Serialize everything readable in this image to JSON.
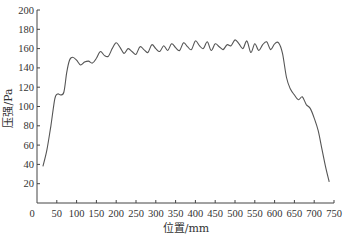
{
  "chart_data": {
    "type": "line",
    "title": "",
    "xlabel": "位置/mm",
    "ylabel": "压强/Pa",
    "xlim": [
      0,
      750
    ],
    "ylim": [
      0,
      200
    ],
    "xticks": [
      0,
      50,
      100,
      150,
      200,
      250,
      300,
      350,
      400,
      450,
      500,
      550,
      600,
      650,
      700,
      750
    ],
    "yticks": [
      20,
      40,
      60,
      80,
      100,
      120,
      140,
      160,
      180,
      200
    ],
    "grid": false,
    "legend": null,
    "series": [
      {
        "name": "压强",
        "color": "#555555",
        "x": [
          15,
          25,
          35,
          45,
          52,
          60,
          68,
          75,
          82,
          90,
          100,
          110,
          120,
          130,
          140,
          150,
          160,
          170,
          180,
          190,
          200,
          210,
          220,
          230,
          240,
          250,
          260,
          270,
          280,
          290,
          300,
          310,
          320,
          330,
          340,
          350,
          360,
          370,
          380,
          390,
          400,
          410,
          420,
          430,
          440,
          450,
          460,
          470,
          480,
          490,
          500,
          510,
          520,
          530,
          540,
          550,
          560,
          570,
          580,
          590,
          600,
          610,
          620,
          630,
          640,
          650,
          660,
          670,
          680,
          690,
          700,
          710,
          720,
          730,
          738
        ],
        "y": [
          38,
          55,
          80,
          108,
          113,
          112,
          115,
          135,
          148,
          151,
          148,
          143,
          146,
          147,
          145,
          150,
          157,
          153,
          152,
          160,
          166,
          161,
          155,
          160,
          157,
          154,
          162,
          159,
          156,
          164,
          160,
          157,
          163,
          158,
          165,
          161,
          158,
          166,
          162,
          159,
          168,
          163,
          160,
          167,
          158,
          165,
          162,
          159,
          164,
          163,
          169,
          165,
          160,
          168,
          156,
          165,
          158,
          164,
          167,
          159,
          165,
          166,
          155,
          130,
          118,
          112,
          107,
          110,
          102,
          98,
          88,
          75,
          55,
          35,
          22
        ]
      }
    ]
  },
  "axes": {
    "x_zero_label": "0"
  }
}
